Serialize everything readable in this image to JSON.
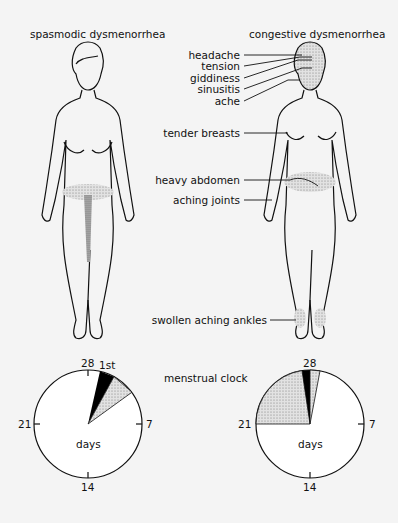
{
  "titles": {
    "left": "spasmodic dysmenorrhea",
    "right": "congestive dysmenorrhea"
  },
  "symptoms": [
    "headache",
    "tension",
    "giddiness",
    "sinusitis",
    "ache",
    "tender breasts",
    "heavy abdomen",
    "aching joints",
    "swollen aching ankles"
  ],
  "clock": {
    "label": "menstrual clock",
    "center_label": "days",
    "ticks": [
      "28",
      "7",
      "14",
      "21"
    ],
    "left_marker": "1st"
  },
  "colors": {
    "background": "#f4f4f4",
    "line": "#111111",
    "stipple": "#c8c8c8",
    "menstrual": "#000000"
  }
}
